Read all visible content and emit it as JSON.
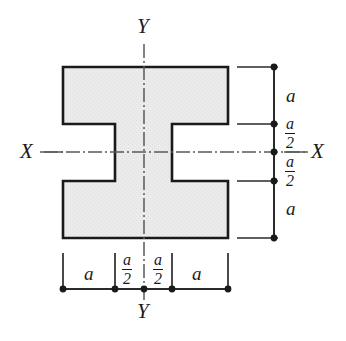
{
  "figure": {
    "type": "engineering-cross-section",
    "background_color": "#ffffff",
    "section_fill_color": "#e9e9e9",
    "section_outline_color": "#1a1a1a",
    "dimension_line_color": "#2a2a2a",
    "centerline_color": "#555555"
  },
  "axes": {
    "horizontal": {
      "name": "X-X",
      "left_label": "X",
      "right_label": "X"
    },
    "vertical": {
      "name": "Y-Y",
      "top_label": "Y",
      "bottom_label": "Y"
    }
  },
  "dimensions": {
    "vertical_chain": {
      "position": "right",
      "segments": [
        {
          "id": "v-top-flange",
          "label_kind": "plain",
          "numerator": "a",
          "denominator": ""
        },
        {
          "id": "v-upper-web",
          "label_kind": "fraction",
          "numerator": "a",
          "denominator": "2"
        },
        {
          "id": "v-lower-web",
          "label_kind": "fraction",
          "numerator": "a",
          "denominator": "2"
        },
        {
          "id": "v-bottom-flange",
          "label_kind": "plain",
          "numerator": "a",
          "denominator": ""
        }
      ]
    },
    "horizontal_chain": {
      "position": "bottom",
      "segments": [
        {
          "id": "h-left-flange",
          "label_kind": "plain",
          "numerator": "a",
          "denominator": ""
        },
        {
          "id": "h-left-web",
          "label_kind": "fraction",
          "numerator": "a",
          "denominator": "2"
        },
        {
          "id": "h-right-web",
          "label_kind": "fraction",
          "numerator": "a",
          "denominator": "2"
        },
        {
          "id": "h-right-flange",
          "label_kind": "plain",
          "numerator": "a",
          "denominator": ""
        }
      ]
    }
  },
  "geometry": {
    "total_width_label": "3a",
    "total_height_label": "3a",
    "web_width_label": "a",
    "flange_thickness_label": "a"
  }
}
